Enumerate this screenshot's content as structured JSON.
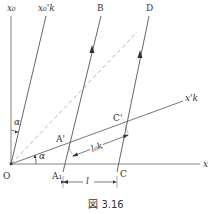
{
  "figure": {
    "caption": "図 3.16"
  },
  "labels": {
    "x0_axis": "x₀",
    "x0k_axis": "x₀'k",
    "x_axis": "x",
    "xk_axis": "x'k",
    "B": "B",
    "D": "D",
    "O": "O",
    "A1": "A₁",
    "C": "C",
    "A_prime": "A'",
    "C_prime": "C'",
    "alpha_top": "α",
    "alpha_bottom": "α",
    "l": "l",
    "l0k": "l₀k"
  },
  "colors": {
    "line": "#555555",
    "dashed": "#999999",
    "text": "#333333"
  }
}
